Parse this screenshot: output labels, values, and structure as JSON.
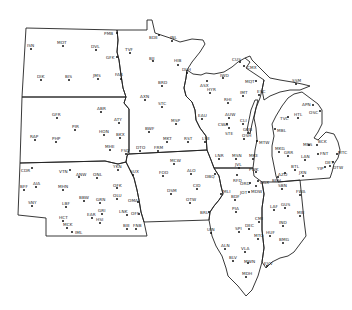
{
  "map": {
    "title": "",
    "colors": {
      "background": "#ffffff",
      "border": "#222222",
      "station": "#111111"
    },
    "stations": [
      {
        "id": "PMB",
        "x": 117,
        "y": 33,
        "lx": 104,
        "ly": 31
      },
      {
        "id": "ISN",
        "x": 31,
        "y": 49,
        "lx": 27,
        "ly": 43
      },
      {
        "id": "MOT",
        "x": 63,
        "y": 46,
        "lx": 57,
        "ly": 40
      },
      {
        "id": "DVL",
        "x": 96,
        "y": 50,
        "lx": 91,
        "ly": 44
      },
      {
        "id": "GFK",
        "x": 117,
        "y": 57,
        "lx": 106,
        "ly": 55
      },
      {
        "id": "TVF",
        "x": 130,
        "y": 53,
        "lx": 125,
        "ly": 47
      },
      {
        "id": "DIK",
        "x": 41,
        "y": 80,
        "lx": 37,
        "ly": 74
      },
      {
        "id": "BIS",
        "x": 69,
        "y": 80,
        "lx": 65,
        "ly": 74
      },
      {
        "id": "JMS",
        "x": 98,
        "y": 79,
        "lx": 93,
        "ly": 73
      },
      {
        "id": "FAR",
        "x": 121,
        "y": 79,
        "lx": 115,
        "ly": 72
      },
      {
        "id": "BDE",
        "x": 159,
        "y": 35,
        "lx": 149,
        "ly": 35
      },
      {
        "id": "INL",
        "x": 172,
        "y": 41,
        "lx": 170,
        "ly": 35
      },
      {
        "id": "BJI",
        "x": 153,
        "y": 61,
        "lx": 149,
        "ly": 56
      },
      {
        "id": "HIB",
        "x": 178,
        "y": 65,
        "lx": 174,
        "ly": 58
      },
      {
        "id": "DLH",
        "x": 187,
        "y": 73,
        "lx": 182,
        "ly": 67
      },
      {
        "id": "BRD",
        "x": 162,
        "y": 86,
        "lx": 158,
        "ly": 80
      },
      {
        "id": "AXN",
        "x": 145,
        "y": 100,
        "lx": 140,
        "ly": 94
      },
      {
        "id": "STC",
        "x": 162,
        "y": 107,
        "lx": 158,
        "ly": 101
      },
      {
        "id": "MSP",
        "x": 176,
        "y": 124,
        "lx": 171,
        "ly": 118
      },
      {
        "id": "BWF",
        "x": 149,
        "y": 132,
        "lx": 145,
        "ly": 126
      },
      {
        "id": "MKT",
        "x": 167,
        "y": 142,
        "lx": 163,
        "ly": 136
      },
      {
        "id": "RST",
        "x": 188,
        "y": 142,
        "lx": 184,
        "ly": 136
      },
      {
        "id": "LSE",
        "x": 205,
        "y": 142,
        "lx": 202,
        "ly": 136
      },
      {
        "id": "DTO",
        "x": 140,
        "y": 151,
        "lx": 136,
        "ly": 145
      },
      {
        "id": "FRM",
        "x": 158,
        "y": 151,
        "lx": 154,
        "ly": 145
      },
      {
        "id": "CUS",
        "x": 240,
        "y": 62,
        "lx": 232,
        "ly": 57
      },
      {
        "id": "CMX",
        "x": 244,
        "y": 66,
        "lx": 247,
        "ly": 65
      },
      {
        "id": "MQT",
        "x": 256,
        "y": 81,
        "lx": 245,
        "ly": 79
      },
      {
        "id": "ESC",
        "x": 259,
        "y": 95,
        "lx": 257,
        "ly": 89
      },
      {
        "id": "ASX",
        "x": 207,
        "y": 81,
        "lx": 200,
        "ly": 83
      },
      {
        "id": "IWD",
        "x": 223,
        "y": 78,
        "lx": 220,
        "ly": 73
      },
      {
        "id": "HYR",
        "x": 210,
        "y": 93,
        "lx": 207,
        "ly": 87
      },
      {
        "id": "IMT",
        "x": 243,
        "y": 96,
        "lx": 240,
        "ly": 90
      },
      {
        "id": "RHI",
        "x": 228,
        "y": 103,
        "lx": 224,
        "ly": 97
      },
      {
        "id": "EAU",
        "x": 202,
        "y": 119,
        "lx": 198,
        "ly": 113
      },
      {
        "id": "AUW",
        "x": 229,
        "y": 118,
        "lx": 225,
        "ly": 112
      },
      {
        "id": "CWA",
        "x": 227,
        "y": 124,
        "lx": 218,
        "ly": 122
      },
      {
        "id": "CLI",
        "x": 243,
        "y": 124,
        "lx": 240,
        "ly": 118
      },
      {
        "id": "STE",
        "x": 229,
        "y": 128,
        "lx": 225,
        "ly": 131
      },
      {
        "id": "GRB",
        "x": 248,
        "y": 133,
        "lx": 243,
        "ly": 127
      },
      {
        "id": "OSH",
        "x": 244,
        "y": 139,
        "lx": 242,
        "ly": 133
      },
      {
        "id": "MTW",
        "x": 257,
        "y": 141,
        "lx": 259,
        "ly": 140
      },
      {
        "id": "FSD",
        "x": 126,
        "y": 154,
        "lx": 121,
        "ly": 148
      },
      {
        "id": "ABR",
        "x": 101,
        "y": 112,
        "lx": 97,
        "ly": 106
      },
      {
        "id": "ATY",
        "x": 119,
        "y": 123,
        "lx": 114,
        "ly": 117
      },
      {
        "id": "PIR",
        "x": 75,
        "y": 130,
        "lx": 72,
        "ly": 124
      },
      {
        "id": "HON",
        "x": 104,
        "y": 135,
        "lx": 99,
        "ly": 129
      },
      {
        "id": "BKX",
        "x": 120,
        "y": 138,
        "lx": 116,
        "ly": 132
      },
      {
        "id": "MHE",
        "x": 110,
        "y": 150,
        "lx": 105,
        "ly": 144
      },
      {
        "id": "GFR",
        "x": 57,
        "y": 118,
        "lx": 52,
        "ly": 112
      },
      {
        "id": "RAP",
        "x": 35,
        "y": 140,
        "lx": 30,
        "ly": 134
      },
      {
        "id": "PHP",
        "x": 56,
        "y": 142,
        "lx": 52,
        "ly": 136
      },
      {
        "id": "YKN",
        "x": 118,
        "y": 170,
        "lx": 113,
        "ly": 164
      },
      {
        "id": "SUX",
        "x": 133,
        "y": 175,
        "lx": 130,
        "ly": 169
      },
      {
        "id": "CDR",
        "x": 32,
        "y": 168,
        "lx": 21,
        "ly": 168
      },
      {
        "id": "VTN",
        "x": 70,
        "y": 170,
        "lx": 59,
        "ly": 169
      },
      {
        "id": "ANW",
        "x": 79,
        "y": 177,
        "lx": 76,
        "ly": 172
      },
      {
        "id": "ONL",
        "x": 97,
        "y": 178,
        "lx": 93,
        "ly": 172
      },
      {
        "id": "AIA",
        "x": 36,
        "y": 187,
        "lx": 33,
        "ly": 181
      },
      {
        "id": "BFF",
        "x": 24,
        "y": 190,
        "lx": 20,
        "ly": 184
      },
      {
        "id": "MHN",
        "x": 63,
        "y": 190,
        "lx": 58,
        "ly": 184
      },
      {
        "id": "OFK",
        "x": 117,
        "y": 188,
        "lx": 113,
        "ly": 183
      },
      {
        "id": "OLU",
        "x": 117,
        "y": 199,
        "lx": 113,
        "ly": 193
      },
      {
        "id": "BBW",
        "x": 84,
        "y": 201,
        "lx": 79,
        "ly": 195
      },
      {
        "id": "GRN",
        "x": 100,
        "y": 203,
        "lx": 96,
        "ly": 197
      },
      {
        "id": "SNY",
        "x": 32,
        "y": 206,
        "lx": 28,
        "ly": 200
      },
      {
        "id": "LBF",
        "x": 66,
        "y": 207,
        "lx": 62,
        "ly": 201
      },
      {
        "id": "GRI",
        "x": 102,
        "y": 214,
        "lx": 98,
        "ly": 208
      },
      {
        "id": "EAR",
        "x": 92,
        "y": 218,
        "lx": 87,
        "ly": 212
      },
      {
        "id": "HSI",
        "x": 100,
        "y": 223,
        "lx": 96,
        "ly": 217
      },
      {
        "id": "OMA",
        "x": 138,
        "y": 202,
        "lx": 128,
        "ly": 198
      },
      {
        "id": "LNK",
        "x": 127,
        "y": 215,
        "lx": 119,
        "ly": 209
      },
      {
        "id": "OFF",
        "x": 139,
        "y": 214,
        "lx": 131,
        "ly": 211
      },
      {
        "id": "HCT",
        "x": 63,
        "y": 221,
        "lx": 59,
        "ly": 215
      },
      {
        "id": "MCK",
        "x": 67,
        "y": 228,
        "lx": 63,
        "ly": 222
      },
      {
        "id": "IML",
        "x": 72,
        "y": 232,
        "lx": 75,
        "ly": 230
      },
      {
        "id": "BIE",
        "x": 127,
        "y": 229,
        "lx": 123,
        "ly": 223
      },
      {
        "id": "FNB",
        "x": 136,
        "y": 229,
        "lx": 133,
        "ly": 223
      },
      {
        "id": "MCW",
        "x": 174,
        "y": 164,
        "lx": 170,
        "ly": 158
      },
      {
        "id": "FOD",
        "x": 163,
        "y": 176,
        "lx": 159,
        "ly": 170
      },
      {
        "id": "ALO",
        "x": 191,
        "y": 174,
        "lx": 187,
        "ly": 168
      },
      {
        "id": "DBQ",
        "x": 215,
        "y": 174,
        "lx": 205,
        "ly": 174
      },
      {
        "id": "CID",
        "x": 197,
        "y": 189,
        "lx": 193,
        "ly": 183
      },
      {
        "id": "DSM",
        "x": 171,
        "y": 194,
        "lx": 167,
        "ly": 188
      },
      {
        "id": "MLI",
        "x": 221,
        "y": 194,
        "lx": 223,
        "ly": 189
      },
      {
        "id": "OTW",
        "x": 190,
        "y": 203,
        "lx": 186,
        "ly": 197
      },
      {
        "id": "BRL",
        "x": 209,
        "y": 212,
        "lx": 200,
        "ly": 210
      },
      {
        "id": "LNR",
        "x": 219,
        "y": 159,
        "lx": 215,
        "ly": 153
      },
      {
        "id": "MSN",
        "x": 236,
        "y": 159,
        "lx": 232,
        "ly": 153
      },
      {
        "id": "MKE",
        "x": 253,
        "y": 159,
        "lx": 249,
        "ly": 153
      },
      {
        "id": "JVL",
        "x": 239,
        "y": 168,
        "lx": 235,
        "ly": 162
      },
      {
        "id": "RFD",
        "x": 237,
        "y": 175,
        "lx": 233,
        "ly": 178
      },
      {
        "id": "ORD",
        "x": 250,
        "y": 183,
        "lx": 240,
        "ly": 181
      },
      {
        "id": "MDW",
        "x": 256,
        "y": 186,
        "lx": 251,
        "ly": 189
      },
      {
        "id": "JOT",
        "x": 249,
        "y": 192,
        "lx": 240,
        "ly": 190
      },
      {
        "id": "CGX",
        "x": 258,
        "y": 181,
        "lx": 260,
        "ly": 180
      },
      {
        "id": "PWK",
        "x": 256,
        "y": 172,
        "lx": 249,
        "ly": 167
      },
      {
        "id": "BDF",
        "x": 235,
        "y": 200,
        "lx": 231,
        "ly": 194
      },
      {
        "id": "PIA",
        "x": 236,
        "y": 212,
        "lx": 232,
        "ly": 206
      },
      {
        "id": "UIN",
        "x": 211,
        "y": 233,
        "lx": 207,
        "ly": 227
      },
      {
        "id": "SPI",
        "x": 239,
        "y": 232,
        "lx": 235,
        "ly": 226
      },
      {
        "id": "CMI",
        "x": 259,
        "y": 222,
        "lx": 255,
        "ly": 216
      },
      {
        "id": "DEC",
        "x": 249,
        "y": 229,
        "lx": 245,
        "ly": 223
      },
      {
        "id": "MTO",
        "x": 258,
        "y": 239,
        "lx": 254,
        "ly": 233
      },
      {
        "id": "ALN",
        "x": 225,
        "y": 249,
        "lx": 221,
        "ly": 243
      },
      {
        "id": "VLA",
        "x": 245,
        "y": 252,
        "lx": 241,
        "ly": 246
      },
      {
        "id": "BLV",
        "x": 233,
        "y": 261,
        "lx": 229,
        "ly": 255
      },
      {
        "id": "MDH",
        "x": 246,
        "y": 277,
        "lx": 242,
        "ly": 271
      },
      {
        "id": "MWN",
        "x": 248,
        "y": 263,
        "lx": 244,
        "ly": 259
      },
      {
        "id": "EVV",
        "x": 267,
        "y": 266,
        "lx": 264,
        "ly": 261
      },
      {
        "id": "LAF",
        "x": 274,
        "y": 210,
        "lx": 270,
        "ly": 204
      },
      {
        "id": "GUS",
        "x": 285,
        "y": 208,
        "lx": 281,
        "ly": 202
      },
      {
        "id": "MIE",
        "x": 300,
        "y": 216,
        "lx": 297,
        "ly": 210
      },
      {
        "id": "IND",
        "x": 283,
        "y": 226,
        "lx": 279,
        "ly": 220
      },
      {
        "id": "HUF",
        "x": 270,
        "y": 236,
        "lx": 266,
        "ly": 230
      },
      {
        "id": "BMG",
        "x": 283,
        "y": 243,
        "lx": 279,
        "ly": 237
      },
      {
        "id": "SBN",
        "x": 282,
        "y": 189,
        "lx": 278,
        "ly": 183
      },
      {
        "id": "FWA",
        "x": 300,
        "y": 195,
        "lx": 296,
        "ly": 189
      },
      {
        "id": "MKG",
        "x": 279,
        "y": 152,
        "lx": 275,
        "ly": 146
      },
      {
        "id": "GRR",
        "x": 288,
        "y": 156,
        "lx": 284,
        "ly": 150
      },
      {
        "id": "LAN",
        "x": 305,
        "y": 160,
        "lx": 301,
        "ly": 154
      },
      {
        "id": "AZO",
        "x": 285,
        "y": 173,
        "lx": 278,
        "ly": 172
      },
      {
        "id": "BEH",
        "x": 278,
        "y": 177,
        "lx": 272,
        "ly": 178
      },
      {
        "id": "BTL",
        "x": 295,
        "y": 170,
        "lx": 291,
        "ly": 164
      },
      {
        "id": "JXN",
        "x": 303,
        "y": 176,
        "lx": 299,
        "ly": 170
      },
      {
        "id": "MBS",
        "x": 309,
        "y": 145,
        "lx": 303,
        "ly": 142
      },
      {
        "id": "BCK",
        "x": 317,
        "y": 145,
        "lx": 318,
        "ly": 139
      },
      {
        "id": "FNT",
        "x": 318,
        "y": 154,
        "lx": 320,
        "ly": 151
      },
      {
        "id": "MTC",
        "x": 337,
        "y": 154,
        "lx": 338,
        "ly": 150
      },
      {
        "id": "DET",
        "x": 333,
        "y": 162,
        "lx": 325,
        "ly": 160
      },
      {
        "id": "YIP",
        "x": 325,
        "y": 167,
        "lx": 317,
        "ly": 166
      },
      {
        "id": "DTW",
        "x": 330,
        "y": 166,
        "lx": 333,
        "ly": 165
      },
      {
        "id": "TVC",
        "x": 288,
        "y": 117,
        "lx": 280,
        "ly": 116
      },
      {
        "id": "HTL",
        "x": 298,
        "y": 118,
        "lx": 294,
        "ly": 112
      },
      {
        "id": "APN",
        "x": 313,
        "y": 105,
        "lx": 302,
        "ly": 102
      },
      {
        "id": "OSC",
        "x": 320,
        "y": 111,
        "lx": 309,
        "ly": 110
      },
      {
        "id": "MBL",
        "x": 275,
        "y": 129,
        "lx": 277,
        "ly": 128
      },
      {
        "id": "SSM",
        "x": 296,
        "y": 84,
        "lx": 292,
        "ly": 78
      }
    ]
  }
}
